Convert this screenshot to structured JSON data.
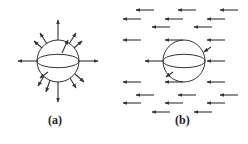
{
  "panels": [
    {
      "id": "a",
      "label": "(a)",
      "description": "Sphere with radially outward arrows",
      "sphere": {
        "cx": 58,
        "cy": 61,
        "r": 21
      },
      "arrows": [
        {
          "x1": 58,
          "y1": 40,
          "x2": 58,
          "y2": 20
        },
        {
          "x1": 79,
          "y1": 61,
          "x2": 98,
          "y2": 61
        },
        {
          "x1": 37,
          "y1": 61,
          "x2": 18,
          "y2": 61
        },
        {
          "x1": 58,
          "y1": 82,
          "x2": 58,
          "y2": 102
        },
        {
          "x1": 47,
          "y1": 44,
          "x2": 40,
          "y2": 33
        },
        {
          "x1": 69,
          "y1": 44,
          "x2": 76,
          "y2": 33
        },
        {
          "x1": 62,
          "y1": 53,
          "x2": 68,
          "y2": 40
        },
        {
          "x1": 74,
          "y1": 48,
          "x2": 82,
          "y2": 41
        },
        {
          "x1": 42,
          "y1": 48,
          "x2": 34,
          "y2": 41
        },
        {
          "x1": 44,
          "y1": 76,
          "x2": 38,
          "y2": 86
        },
        {
          "x1": 48,
          "y1": 72,
          "x2": 40,
          "y2": 78
        },
        {
          "x1": 50,
          "y1": 80,
          "x2": 46,
          "y2": 92
        },
        {
          "x1": 70,
          "y1": 78,
          "x2": 76,
          "y2": 88
        },
        {
          "x1": 75,
          "y1": 74,
          "x2": 84,
          "y2": 82
        }
      ],
      "label_pos": {
        "x": 48,
        "y": 121
      }
    },
    {
      "id": "b",
      "label": "(b)",
      "description": "Sphere in uniform leftward field",
      "sphere": {
        "cx": 184,
        "cy": 61,
        "r": 21
      },
      "arrows": [
        {
          "x1": 154,
          "y1": 10,
          "x2": 136,
          "y2": 10
        },
        {
          "x1": 196,
          "y1": 10,
          "x2": 178,
          "y2": 10
        },
        {
          "x1": 238,
          "y1": 10,
          "x2": 220,
          "y2": 10
        },
        {
          "x1": 141,
          "y1": 19,
          "x2": 123,
          "y2": 19
        },
        {
          "x1": 183,
          "y1": 19,
          "x2": 165,
          "y2": 19
        },
        {
          "x1": 225,
          "y1": 19,
          "x2": 207,
          "y2": 19
        },
        {
          "x1": 170,
          "y1": 27,
          "x2": 152,
          "y2": 27
        },
        {
          "x1": 212,
          "y1": 27,
          "x2": 194,
          "y2": 27
        },
        {
          "x1": 141,
          "y1": 40,
          "x2": 123,
          "y2": 40
        },
        {
          "x1": 183,
          "y1": 40,
          "x2": 165,
          "y2": 40
        },
        {
          "x1": 225,
          "y1": 40,
          "x2": 207,
          "y2": 40
        },
        {
          "x1": 211,
          "y1": 47,
          "x2": 204,
          "y2": 52
        },
        {
          "x1": 163,
          "y1": 61,
          "x2": 145,
          "y2": 61
        },
        {
          "x1": 225,
          "y1": 61,
          "x2": 207,
          "y2": 61
        },
        {
          "x1": 173,
          "y1": 72,
          "x2": 166,
          "y2": 77
        },
        {
          "x1": 141,
          "y1": 82,
          "x2": 123,
          "y2": 82
        },
        {
          "x1": 183,
          "y1": 82,
          "x2": 165,
          "y2": 82
        },
        {
          "x1": 225,
          "y1": 82,
          "x2": 207,
          "y2": 82
        },
        {
          "x1": 154,
          "y1": 95,
          "x2": 136,
          "y2": 95
        },
        {
          "x1": 196,
          "y1": 95,
          "x2": 178,
          "y2": 95
        },
        {
          "x1": 238,
          "y1": 95,
          "x2": 220,
          "y2": 95
        },
        {
          "x1": 141,
          "y1": 103,
          "x2": 123,
          "y2": 103
        },
        {
          "x1": 183,
          "y1": 103,
          "x2": 165,
          "y2": 103
        },
        {
          "x1": 225,
          "y1": 103,
          "x2": 207,
          "y2": 103
        },
        {
          "x1": 170,
          "y1": 112,
          "x2": 152,
          "y2": 112
        },
        {
          "x1": 212,
          "y1": 112,
          "x2": 194,
          "y2": 112
        }
      ],
      "label_pos": {
        "x": 175,
        "y": 121
      }
    }
  ],
  "colors": {
    "stroke": "#333333",
    "background": "#ffffff"
  }
}
